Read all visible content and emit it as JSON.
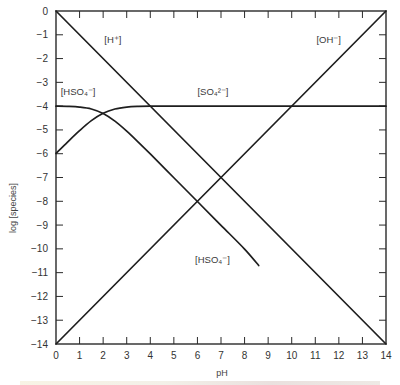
{
  "chart_data": {
    "type": "line",
    "title": "",
    "xlabel": "pH",
    "ylabel": "log [species]",
    "xlim": [
      0,
      14
    ],
    "ylim": [
      -14,
      0
    ],
    "x_ticks": [
      0,
      1,
      2,
      3,
      4,
      5,
      6,
      7,
      8,
      9,
      10,
      11,
      12,
      13,
      14
    ],
    "y_ticks": [
      0,
      -1,
      -2,
      -3,
      -4,
      -5,
      -6,
      -7,
      -8,
      -9,
      -10,
      -11,
      -12,
      -13,
      -14
    ],
    "grid": false,
    "legend": "none (inline labels)",
    "series": [
      {
        "name": "[H+]",
        "label_text": "[H⁺]",
        "label_pos": {
          "x": 2.05,
          "y": -1.35
        },
        "x": [
          0,
          14
        ],
        "y": [
          0,
          -14
        ]
      },
      {
        "name": "[OH-]",
        "label_text": "[OH⁻]",
        "label_pos": {
          "x": 11.05,
          "y": -1.35
        },
        "x": [
          0,
          14
        ],
        "y": [
          -14,
          0
        ]
      },
      {
        "name": "[SO4 2-]",
        "label_text": "[SO₄²⁻]",
        "label_pos": {
          "x": 6.0,
          "y": -3.55
        },
        "x": [
          0,
          0.5,
          1,
          1.5,
          2,
          2.5,
          3,
          3.5,
          4,
          5,
          6,
          8,
          10,
          12,
          14
        ],
        "y": [
          -5.99,
          -5.5,
          -5.03,
          -4.61,
          -4.3,
          -4.12,
          -4.04,
          -4.01,
          -4.0,
          -4.0,
          -4.0,
          -4.0,
          -4.0,
          -4.0,
          -4.0
        ]
      },
      {
        "name": "[HSO4-] (upper label)",
        "label_text": "[HSO₄⁻]",
        "label_pos": {
          "x": 0.2,
          "y": -3.55
        },
        "x": [
          0,
          0.5,
          1,
          1.5,
          2,
          2.5,
          3,
          3.5,
          4,
          5,
          6,
          7,
          8,
          8.6
        ],
        "y": [
          -4.0,
          -4.01,
          -4.04,
          -4.12,
          -4.31,
          -4.63,
          -5.05,
          -5.52,
          -6.01,
          -7.01,
          -8.01,
          -9.01,
          -10.01,
          -10.7
        ]
      }
    ],
    "extra_labels": [
      {
        "text": "[HSO₄⁻]",
        "x": 5.9,
        "y": -10.6
      }
    ]
  },
  "colors": {
    "line": "#1e1e1e",
    "axis": "#2a2a2a",
    "text": "#333333",
    "background": "#ffffff"
  }
}
